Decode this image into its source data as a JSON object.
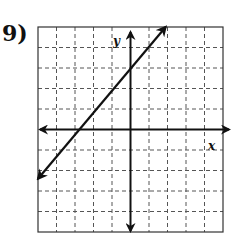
{
  "problem": {
    "number_label": "9)"
  },
  "chart_data": {
    "type": "line",
    "title": "",
    "xlabel": "x",
    "ylabel": "y",
    "xlim": [
      -5,
      5
    ],
    "ylim": [
      -5,
      5
    ],
    "grid": true,
    "grid_style": "dashed",
    "tick_step": 1,
    "tick_labels": false,
    "axes_arrows": true,
    "series": [
      {
        "name": "line",
        "arrows_both_ends": true,
        "points": [
          {
            "x": -5,
            "y": -2.4
          },
          {
            "x": -2.7,
            "y": 0
          },
          {
            "x": 0,
            "y": 3
          },
          {
            "x": 1.9,
            "y": 5
          }
        ],
        "y_intercept": 3,
        "x_intercept_approx": -2.7
      }
    ]
  },
  "colors": {
    "ink": "#111111",
    "grid": "#555555",
    "background": "#ffffff"
  }
}
